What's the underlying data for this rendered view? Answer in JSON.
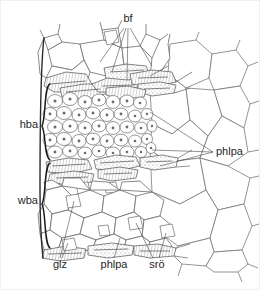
{
  "figure": {
    "type": "botanical-histology-line-drawing",
    "background_color": "#ffffff",
    "ink_color": "#4f4f4f",
    "label_color": "#262626",
    "width": 260,
    "height": 290
  },
  "labels": [
    {
      "id": "bf",
      "text": "bf",
      "meaning": "bast fibres",
      "x": 128,
      "y": 22,
      "anchor": "middle",
      "leader_targets": [
        [
          112,
          72
        ],
        [
          127,
          78
        ],
        [
          152,
          68
        ]
      ]
    },
    {
      "id": "hba",
      "text": "hba",
      "meaning": "hard bast area",
      "x": 38,
      "y": 128,
      "anchor": "end",
      "brace": {
        "x": 44,
        "top": 84,
        "bottom": 160
      }
    },
    {
      "id": "wba",
      "text": "wba",
      "meaning": "soft bast area",
      "x": 38,
      "y": 204,
      "anchor": "end",
      "brace": {
        "x": 44,
        "top": 163,
        "bottom": 248
      }
    },
    {
      "id": "phlpa-right",
      "text": "phlpa",
      "meaning": "phloem parenchyma",
      "x": 216,
      "y": 155,
      "anchor": "start",
      "leader_targets": [
        [
          150,
          112
        ],
        [
          152,
          150
        ],
        [
          158,
          164
        ]
      ]
    },
    {
      "id": "glz",
      "text": "glz",
      "meaning": "sclerenchyma / stone cells",
      "x": 60,
      "y": 268,
      "anchor": "middle",
      "leader_targets": [
        [
          74,
          200
        ],
        [
          66,
          242
        ]
      ]
    },
    {
      "id": "phlpa-bottom",
      "text": "phlpa",
      "meaning": "phloem parenchyma",
      "x": 114,
      "y": 268,
      "anchor": "middle",
      "leader_targets": [
        [
          120,
          238
        ]
      ]
    },
    {
      "id": "sro",
      "text": "srö",
      "meaning": "secretory canals",
      "x": 157,
      "y": 268,
      "anchor": "middle",
      "leader_targets": [
        [
          139,
          222
        ],
        [
          166,
          232
        ]
      ]
    }
  ],
  "regions": [
    {
      "id": "outer-cortex",
      "label": "large polygonal outer cortex cells",
      "y_range": [
        42,
        78
      ]
    },
    {
      "id": "bast-fibre-band-upper",
      "label": "upper bast fibre band",
      "y_range": [
        66,
        92
      ]
    },
    {
      "id": "hba-parenchyma",
      "label": "dense small parenchyma cells with nuclei",
      "y_range": [
        86,
        158
      ]
    },
    {
      "id": "bast-fibre-band-middle",
      "label": "middle bast fibre band",
      "y_range": [
        155,
        178
      ]
    },
    {
      "id": "wba-parenchyma",
      "label": "large polygonal soft bast cells",
      "y_range": [
        176,
        240
      ]
    },
    {
      "id": "bast-fibre-band-lower",
      "label": "lower bast fibre band",
      "y_range": [
        236,
        252
      ]
    },
    {
      "id": "right-open-cells",
      "label": "large open cells on right margin",
      "y_range": [
        42,
        255
      ]
    }
  ]
}
